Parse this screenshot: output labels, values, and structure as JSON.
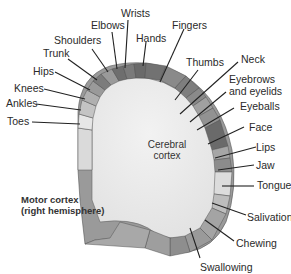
{
  "diagram": {
    "title_line1": "Motor cortex",
    "title_line2": "(right hemisphere)",
    "center_line1": "Cerebral",
    "center_line2": "cortex",
    "labels": {
      "toes": "Toes",
      "ankles": "Ankles",
      "knees": "Knees",
      "hips": "Hips",
      "trunk": "Trunk",
      "shoulders": "Shoulders",
      "elbows": "Elbows",
      "wrists": "Wrists",
      "hands": "Hands",
      "fingers": "Fingers",
      "thumbs": "Thumbs",
      "neck": "Neck",
      "eyebrows_line1": "Eyebrows",
      "eyebrows_line2": "and eyelids",
      "eyeballs": "Eyeballs",
      "face": "Face",
      "lips": "Lips",
      "jaw": "Jaw",
      "tongue": "Tongue",
      "salivation": "Salivation",
      "chewing": "Chewing",
      "swallowing": "Swallowing"
    },
    "colors": {
      "cortex_fill": "#ececec",
      "band_dark": "#6e6e6e",
      "band_mid": "#8e8e8e",
      "band_light": "#b5b5b5",
      "band_pale": "#d6d6d6",
      "leader_line": "#222222"
    }
  }
}
